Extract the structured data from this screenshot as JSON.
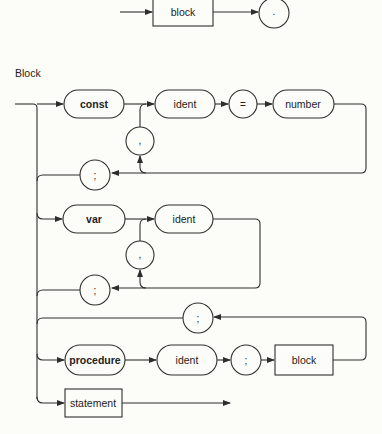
{
  "program_diagram": {
    "block_label": "block",
    "period_label": "."
  },
  "block_section": {
    "title": "Block",
    "const_row": {
      "keyword": "const",
      "ident": "ident",
      "equals": "=",
      "number": "number",
      "comma": ",",
      "semicolon": ";"
    },
    "var_row": {
      "keyword": "var",
      "ident": "ident",
      "comma": ",",
      "semicolon": ";"
    },
    "procedure_row": {
      "keyword": "procedure",
      "ident": "ident",
      "semicolon": ";",
      "block": "block",
      "loop_semicolon": ";"
    },
    "statement_row": {
      "statement": "statement"
    }
  }
}
